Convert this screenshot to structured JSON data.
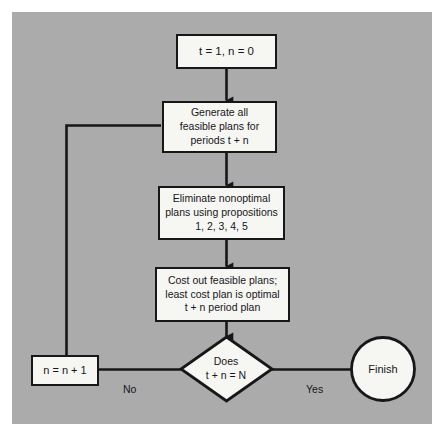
{
  "diagram": {
    "background_color": "#ababab",
    "node_fill_color": "#f6f6f3",
    "line_color": "#17171a",
    "nodes": {
      "init": {
        "shape": "rectangle",
        "text": "t = 1,  n = 0"
      },
      "generate": {
        "shape": "rectangle",
        "text": "Generate all\nfeasible plans for\nperiods  t + n"
      },
      "eliminate": {
        "shape": "rectangle",
        "text": "Eliminate nonoptimal\nplans using propositions\n1, 2, 3, 4, 5"
      },
      "cost": {
        "shape": "rectangle",
        "text": "Cost out feasible plans;\nleast cost plan is optimal\nt + n period plan"
      },
      "decision": {
        "shape": "diamond",
        "text": "Does\nt + n = N"
      },
      "increment": {
        "shape": "rectangle",
        "text": "n = n + 1"
      },
      "finish": {
        "shape": "circle",
        "text": "Finish"
      }
    },
    "edge_labels": {
      "no": "No",
      "yes": "Yes"
    }
  }
}
